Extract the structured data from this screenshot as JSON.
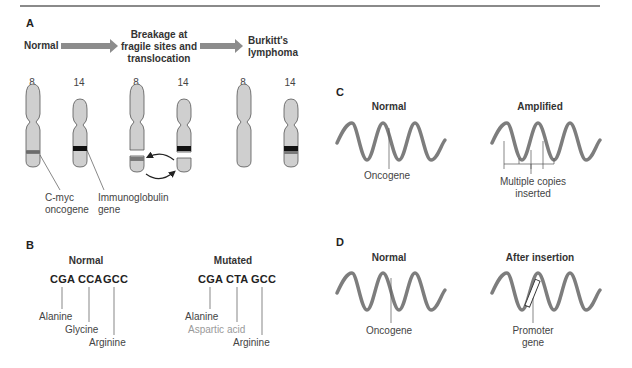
{
  "panel_a": {
    "letter": "A",
    "stage_normal": "Normal",
    "stage_breakage_line1": "Breakage at",
    "stage_breakage_line2": "fragile sites and",
    "stage_breakage_line3": "translocation",
    "stage_burkitt_line1": "Burkitt's",
    "stage_burkitt_line2": "lymphoma",
    "chromosome_numbers": [
      "8",
      "14",
      "8",
      "14",
      "8",
      "14"
    ],
    "label_cmyc_line1": "C-myc",
    "label_cmyc_line2": "oncogene",
    "label_ig_line1": "Immunoglobulin",
    "label_ig_line2": "gene"
  },
  "panel_b": {
    "letter": "B",
    "normal": {
      "title": "Normal",
      "codons": [
        "CGA",
        "CCA",
        "GCC"
      ],
      "amino_acids": [
        "Alanine",
        "Glycine",
        "Arginine"
      ]
    },
    "mutated": {
      "title": "Mutated",
      "codons": [
        "CGA",
        "CTA",
        "GCC"
      ],
      "amino_acids": [
        "Alanine",
        "Aspartic acid",
        "Arginine"
      ]
    }
  },
  "panel_c": {
    "letter": "C",
    "normal_title": "Normal",
    "amplified_title": "Amplified",
    "normal_label": "Oncogene",
    "amplified_label_line1": "Multiple copies",
    "amplified_label_line2": "inserted"
  },
  "panel_d": {
    "letter": "D",
    "normal_title": "Normal",
    "insertion_title": "After insertion",
    "normal_label": "Oncogene",
    "insertion_label_line1": "Promoter",
    "insertion_label_line2": "gene"
  },
  "colors": {
    "rule": "#8a8a8a",
    "arrow": "#8c8c8c",
    "chromosome_fill": "#cfcfcf",
    "chromosome_stroke": "#555555",
    "band_cmyc": "#7a7a7a",
    "band_ig": "#111111",
    "dna_wave": "#7d7d7d",
    "mutated_label": "#9a9a9a"
  }
}
